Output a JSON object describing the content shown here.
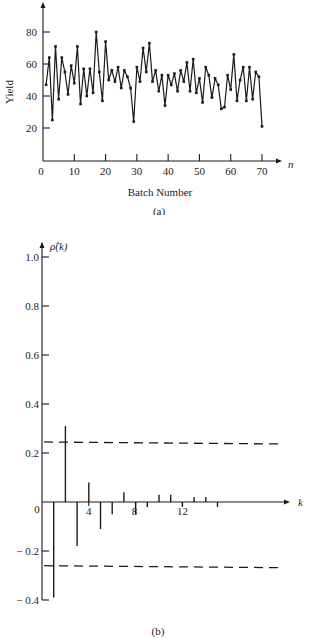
{
  "chart_data": [
    {
      "panel": "(a)",
      "type": "line",
      "title": "",
      "xlabel": "Batch Number",
      "ylabel": "Yield",
      "x_axis_symbol": "n",
      "xlim": [
        0,
        70
      ],
      "ylim": [
        0,
        95
      ],
      "x_ticks": [
        0,
        10,
        20,
        30,
        40,
        50,
        60,
        70
      ],
      "y_ticks": [
        20,
        40,
        60,
        80
      ],
      "grid": false,
      "markers": true,
      "x": [
        1,
        2,
        3,
        4,
        5,
        6,
        7,
        8,
        9,
        10,
        11,
        12,
        13,
        14,
        15,
        16,
        17,
        18,
        19,
        20,
        21,
        22,
        23,
        24,
        25,
        26,
        27,
        28,
        29,
        30,
        31,
        32,
        33,
        34,
        35,
        36,
        37,
        38,
        39,
        40,
        41,
        42,
        43,
        44,
        45,
        46,
        47,
        48,
        49,
        50,
        51,
        52,
        53,
        54,
        55,
        56,
        57,
        58,
        59,
        60,
        61,
        62,
        63,
        64,
        65,
        66,
        67,
        68,
        69,
        70
      ],
      "values": [
        47,
        64,
        25,
        71,
        38,
        64,
        55,
        41,
        59,
        48,
        71,
        35,
        57,
        40,
        57,
        42,
        80,
        55,
        37,
        74,
        50,
        56,
        49,
        58,
        45,
        56,
        52,
        45,
        24,
        58,
        49,
        70,
        55,
        73,
        49,
        56,
        43,
        53,
        34,
        53,
        47,
        54,
        43,
        56,
        49,
        61,
        43,
        63,
        42,
        51,
        36,
        58,
        53,
        39,
        51,
        47,
        32,
        33,
        53,
        44,
        66,
        37,
        50,
        58,
        37,
        58,
        38,
        55,
        52,
        21
      ]
    },
    {
      "panel": "(b)",
      "type": "bar",
      "subtype": "stem",
      "title": "",
      "xlabel": "k",
      "ylabel": "ρ̂(k)",
      "xlim": [
        0,
        20
      ],
      "ylim": [
        -0.4,
        1.0
      ],
      "x_ticks": [
        4,
        8,
        12
      ],
      "y_ticks": [
        -0.4,
        -0.2,
        0.2,
        0.4,
        0.6,
        0.8,
        1.0
      ],
      "origin_label": "0",
      "grid": false,
      "categories": [
        1,
        2,
        3,
        4,
        5,
        6,
        7,
        8,
        9,
        10,
        11,
        12,
        13,
        14,
        15
      ],
      "values": [
        -0.39,
        0.31,
        -0.18,
        0.08,
        -0.11,
        -0.05,
        0.04,
        -0.05,
        -0.02,
        0.03,
        0.03,
        -0.02,
        0.02,
        0.02,
        -0.02
      ],
      "confidence_bands": {
        "upper": 0.245,
        "lower": -0.26,
        "style": "dashed"
      }
    }
  ],
  "captions": {
    "a": "(a)",
    "b": "(b)"
  },
  "labels": {
    "a_ylabel": "Yield",
    "a_xlabel": "Batch Number",
    "a_xsymbol": "n",
    "b_ylabel": "ρ̂(k)",
    "b_xsymbol": "k",
    "b_origin": "0"
  }
}
